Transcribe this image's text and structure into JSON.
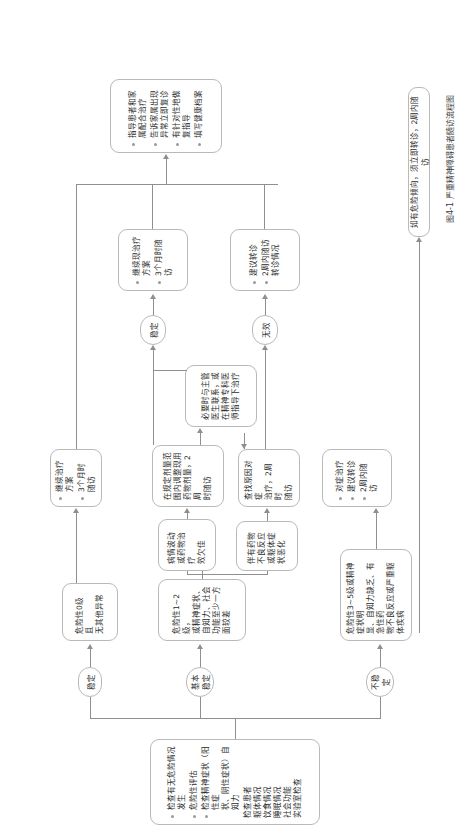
{
  "figure": {
    "caption": "图4-1  严重精神障碍患者随访流程图",
    "orientation_deg": -90
  },
  "nodes": {
    "assessment": {
      "name": "初次评估",
      "items": [
        "检查有无危险情况发生",
        "危险性评估",
        "检查精神症状（阳性症\n状、阴性症状）自知力",
        "检查患者\n躯体情况\n饮食情况\n睡眠情况\n社会功能\n实验室检查"
      ]
    },
    "no_risk": {
      "name": "危险性0级且无其他异常",
      "text": "危险性0级且\n无其他异常"
    },
    "basic_stable_case": {
      "name": "基本稳定病情描述",
      "text": "危险性1~2级，\n或精神症状、\n自知力、社会\n功能至少一方\n面较差"
    },
    "fluctuation_case": {
      "name": "病情波动描述",
      "text": "病情波动\n或药物治疗\n效欠佳"
    },
    "adverse_case": {
      "name": "药物不良反应描述",
      "text": "伴有药物\n不良反应\n或躯体症\n状恶化"
    },
    "unstable_case": {
      "name": "不稳定病情描述",
      "text": "危险性3~5级或精神症状明\n显、自知力缺乏、有急性药\n物不良反应或严重躯体疾病"
    },
    "adjust_dose": {
      "name": "调整药物剂量",
      "text": "在规定剂量范\n围内调整现用\n药物剂量，2周\n时随访"
    },
    "contact_doctor": {
      "name": "联系主管医生",
      "text": "必要时与主管\n医生联系，或\n在精神专科医\n师指导下治疗"
    },
    "find_cause": {
      "name": "查找原因对症治疗",
      "text": "查找原因对症\n治疗，2周时\n随访"
    },
    "symptomatic_referral": {
      "name": "对症治疗并转诊",
      "items": [
        "对症治疗",
        "建议转诊",
        "2周内随访"
      ]
    },
    "continue_plan_left": {
      "name": "继续治疗方案",
      "items": [
        "继续治疗方案",
        "3个月时随访"
      ]
    },
    "continue_plan_mid": {
      "name": "继续现治疗方案",
      "items": [
        "继续现治疗\n方案",
        "3个月时随访"
      ]
    },
    "suggest_referral": {
      "name": "建议转诊",
      "items": [
        "建议转诊",
        "2周内随访\n转诊情况"
      ]
    },
    "guidance": {
      "name": "指导与健康档案",
      "items": [
        "指导患者和家\n属配合治疗",
        "告诉家属出现\n异常立即复诊",
        "有针对性地做\n复指导",
        "填写健康档案"
      ]
    },
    "risk_note": {
      "name": "危险倾向提示",
      "text": "如有危险倾向，须立即转诊，2周内随访"
    }
  },
  "edge_labels": {
    "stable": "稳定",
    "basic_stable": "基本稳定",
    "unstable": "不稳定",
    "stable2": "稳定",
    "ineffective": "无效"
  }
}
